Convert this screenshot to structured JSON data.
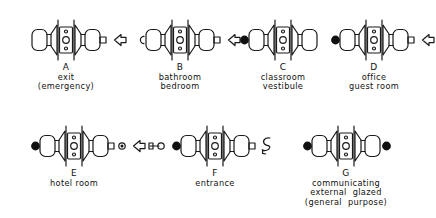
{
  "diagram": {
    "background_color": "#ffffff",
    "line_color": "#1a1a1a",
    "fill_color": "#111111"
  },
  "items": [
    {
      "ref": "A",
      "caption_line1": "exit",
      "caption_line2": "(emergency)",
      "x": 14,
      "y": 18,
      "left_marker": "none",
      "right_marker": "arrow-left",
      "left_outer_symbol": "none",
      "right_outer_symbol": "none",
      "right_stub": true
    },
    {
      "ref": "B",
      "caption_line1": "bathroom",
      "caption_line2": "bedroom",
      "x": 128,
      "y": 18,
      "left_marker": "turn-button",
      "right_marker": "arrow-left",
      "left_outer_symbol": "none",
      "right_outer_symbol": "none",
      "right_stub": true
    },
    {
      "ref": "C",
      "caption_line1": "classroom",
      "caption_line2": "vestibule",
      "x": 231,
      "y": 18,
      "left_marker": "keyhole-dot",
      "right_marker": "none",
      "left_outer_symbol": "none",
      "right_outer_symbol": "none",
      "right_stub": false
    },
    {
      "ref": "D",
      "caption_line1": "office",
      "caption_line2": "guest room",
      "x": 322,
      "y": 18,
      "left_marker": "keyhole-dot",
      "right_marker": "arrow-left",
      "left_outer_symbol": "none",
      "right_outer_symbol": "none",
      "right_stub": true
    },
    {
      "ref": "E",
      "caption_line1": "hotel room",
      "caption_line2": "",
      "x": 22,
      "y": 124,
      "left_marker": "keyhole-dot",
      "right_marker": "arrow-left",
      "left_outer_symbol": "none",
      "right_outer_symbol": "key",
      "right_stub": true,
      "right_indicator_dot": true
    },
    {
      "ref": "F",
      "caption_line1": "entrance",
      "caption_line2": "",
      "x": 163,
      "y": 124,
      "left_marker": "keyhole-dot",
      "right_marker": "thumb-turn",
      "left_outer_symbol": "none",
      "right_outer_symbol": "none",
      "right_stub": true
    },
    {
      "ref": "G",
      "caption_line1": "communicating",
      "caption_line2": "external  glazed",
      "caption_line3": "(general  purpose)",
      "x": 294,
      "y": 124,
      "left_marker": "keyhole-dot",
      "right_marker": "keyhole-dot",
      "left_outer_symbol": "none",
      "right_outer_symbol": "none",
      "right_stub": false
    }
  ]
}
